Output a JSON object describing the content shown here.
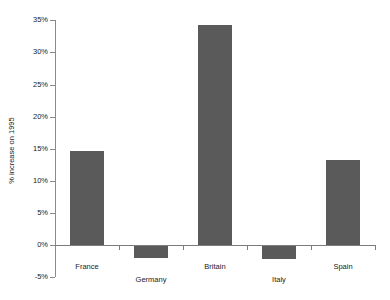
{
  "chart_data": {
    "type": "bar",
    "title": "",
    "subtitle": "",
    "xlabel": "",
    "ylabel": "% increase on 1995",
    "categories": [
      "France",
      "Germany",
      "Britain",
      "Italy",
      "Spain"
    ],
    "values": [
      14.7,
      -2.0,
      34.3,
      -2.2,
      13.3
    ],
    "ylim": [
      -5,
      35
    ],
    "ytick_values": [
      35,
      30,
      25,
      20,
      15,
      10,
      5,
      0,
      -5
    ],
    "ytick_labels": [
      "35%",
      "30%",
      "25%",
      "20%",
      "15%",
      "10%",
      "5%",
      "0%",
      "-5%"
    ],
    "grid": false,
    "legend": false,
    "bar_color": "#5a5a5a",
    "axis_color": "#8a8a8a",
    "text_color": "#1a1a1a"
  }
}
